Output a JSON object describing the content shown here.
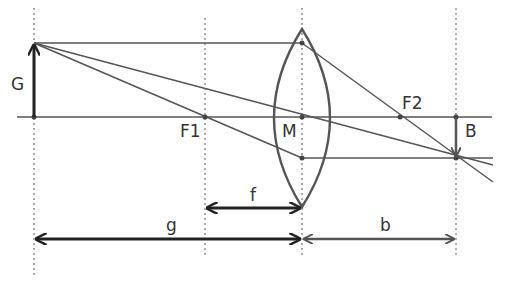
{
  "diagram": {
    "type": "thin-lens-image-formation",
    "labels": {
      "object": "G",
      "image": "B",
      "focal_point_1": "F1",
      "focal_point_2": "F2",
      "center": "M",
      "focal_length": "f",
      "object_distance": "g",
      "image_distance": "b"
    },
    "colors": {
      "line": "#555555",
      "arrow": "#222222",
      "image_arrow": "#555555",
      "dotted": "#777777"
    }
  }
}
